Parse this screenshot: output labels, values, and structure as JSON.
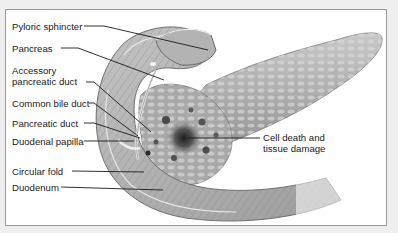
{
  "figure": {
    "labels": [
      {
        "id": "pyloric-sphincter",
        "text": "Pyloric sphincter"
      },
      {
        "id": "pancreas",
        "text": "Pancreas"
      },
      {
        "id": "accessory-pancreatic-duct",
        "text": "Accessory\npancreatic duct"
      },
      {
        "id": "common-bile-duct",
        "text": "Common bile duct"
      },
      {
        "id": "pancreatic-duct",
        "text": "Pancreatic duct"
      },
      {
        "id": "duodenal-papilla",
        "text": "Duodenal papilla"
      },
      {
        "id": "circular-fold",
        "text": "Circular fold"
      },
      {
        "id": "duodenum",
        "text": "Duodenum"
      },
      {
        "id": "cell-death",
        "text": "Cell death and\ntissue damage"
      }
    ],
    "colors": {
      "background": "#efefef",
      "panel": "#ffffff",
      "border": "#9a9a9a",
      "tissue_light": "#bdbdbd",
      "tissue_mid": "#9a9a9a",
      "tissue_dark": "#6e6e6e",
      "damage": "#2e2e2e",
      "leader": "#1a1a1a"
    }
  }
}
